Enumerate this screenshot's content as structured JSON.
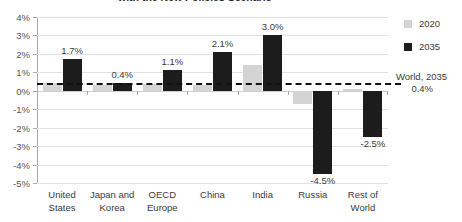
{
  "chart_data": {
    "type": "bar",
    "title": "with the New Policies Scenario",
    "xlabel": "",
    "ylabel": "",
    "ylim": [
      -5,
      4
    ],
    "ytick_step": 1,
    "ytick_labels": [
      "4%",
      "3%",
      "2%",
      "1%",
      "0%",
      "-1%",
      "-2%",
      "-3%",
      "-4%",
      "-5%"
    ],
    "ytick_values": [
      4,
      3,
      2,
      1,
      0,
      -1,
      -2,
      -3,
      -4,
      -5
    ],
    "grid": true,
    "legend_position": "right",
    "categories": [
      "United States",
      "Japan and Korea",
      "OECD Europe",
      "China",
      "India",
      "Russia",
      "Rest of World"
    ],
    "category_lines": [
      [
        "United",
        "States"
      ],
      [
        "Japan and",
        "Korea"
      ],
      [
        "OECD",
        "Europe"
      ],
      [
        "China",
        ""
      ],
      [
        "India",
        ""
      ],
      [
        "Russia",
        ""
      ],
      [
        "Rest of",
        "World"
      ]
    ],
    "series": [
      {
        "name": "2020",
        "color": "#d4d4d4",
        "values": [
          0.4,
          0.3,
          0.35,
          0.3,
          1.4,
          -0.7,
          0.1
        ],
        "labels": [
          "",
          "",
          "",
          "",
          "",
          "",
          ""
        ]
      },
      {
        "name": "2035",
        "color": "#1c1c1c",
        "values": [
          1.7,
          0.4,
          1.1,
          2.1,
          3.0,
          -4.5,
          -2.5
        ],
        "labels": [
          "1.7%",
          "0.4%",
          "1.1%",
          "2.1%",
          "3.0%",
          "-4.5%",
          "-2.5%"
        ]
      }
    ],
    "reference_line": {
      "label": "World, 2035",
      "value_label": "0.4%",
      "value": 0.4,
      "style": "dashed",
      "color": "#111111"
    }
  },
  "legend": {
    "items": [
      {
        "label": "2020"
      },
      {
        "label": "2035"
      }
    ]
  }
}
